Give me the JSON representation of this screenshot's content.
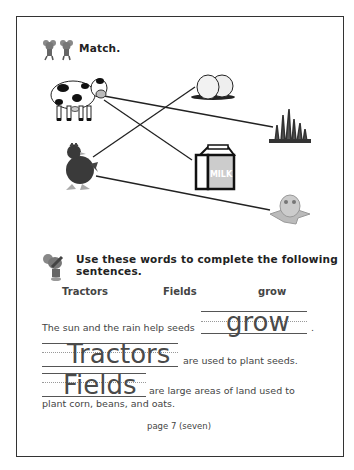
{
  "section1": {
    "heading": "Match.",
    "items_left": [
      "cow-icon",
      "hen-icon"
    ],
    "items_right": [
      "eggs-icon",
      "grass-icon",
      "milk-carton-icon",
      "chick-icon"
    ],
    "milk_label": "MILK",
    "matches": [
      {
        "from": "cow",
        "to": "grass"
      },
      {
        "from": "cow",
        "to": "milk"
      },
      {
        "from": "hen",
        "to": "eggs"
      },
      {
        "from": "hen",
        "to": "chick"
      }
    ]
  },
  "section2": {
    "heading_line1": "Use these words to complete the following",
    "heading_line2": "sentences.",
    "word_bank": [
      "Tractors",
      "Fields",
      "grow"
    ],
    "sentences": [
      {
        "before": "The sun and the rain help seeds",
        "answer": "grow",
        "after": "."
      },
      {
        "answer": "Tractors",
        "after": "are used to plant seeds."
      },
      {
        "answer": "Fields",
        "after": "are large areas of land used to",
        "continuation": "plant corn, beans, and oats."
      }
    ]
  },
  "footer": {
    "page_label": "page 7 (seven)"
  }
}
